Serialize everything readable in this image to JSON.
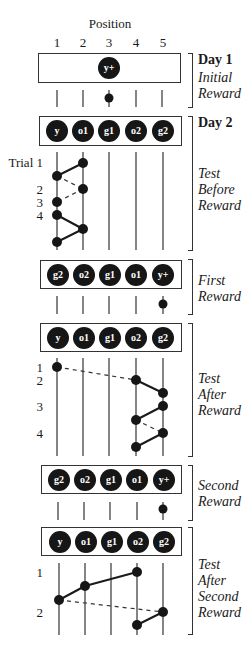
{
  "header": {
    "position_label": "Position",
    "position_numbers": [
      "1",
      "2",
      "3",
      "4",
      "5"
    ]
  },
  "panels": [
    {
      "day": "Day 1",
      "phase": [
        "Initial",
        "Reward"
      ],
      "box_items": [
        "",
        "",
        "y+",
        "",
        ""
      ],
      "reward_dot_position": 3
    },
    {
      "day": "Day 2",
      "phase": [
        "Test",
        "Before",
        "Reward"
      ],
      "box_items": [
        "y",
        "o1",
        "g1",
        "o2",
        "g2"
      ],
      "trial_labels": [
        "Trial 1",
        "2",
        "3",
        "4"
      ],
      "choice_sequence_positions": [
        2,
        1,
        2,
        1,
        1,
        2,
        1
      ]
    },
    {
      "phase": [
        "First",
        "Reward"
      ],
      "box_items": [
        "g2",
        "o2",
        "g1",
        "o1",
        "y+"
      ],
      "reward_dot_position": 5
    },
    {
      "phase": [
        "Test",
        "After",
        "Reward"
      ],
      "box_items": [
        "y",
        "o1",
        "g1",
        "o2",
        "g2"
      ],
      "trial_labels": [
        "1",
        "2",
        "3",
        "4"
      ],
      "choice_sequence_positions": [
        1,
        4,
        5,
        5,
        4,
        5,
        4
      ]
    },
    {
      "phase": [
        "Second",
        "Reward"
      ],
      "box_items": [
        "g2",
        "o2",
        "g1",
        "o1",
        "y+"
      ],
      "reward_dot_position": 5
    },
    {
      "phase": [
        "Test",
        "After",
        "Second",
        "Reward"
      ],
      "box_items": [
        "y",
        "o1",
        "g1",
        "o2",
        "g2"
      ],
      "trial_labels": [
        "1",
        "2"
      ],
      "choice_sequence_positions": [
        4,
        2,
        1,
        5,
        4
      ]
    }
  ]
}
